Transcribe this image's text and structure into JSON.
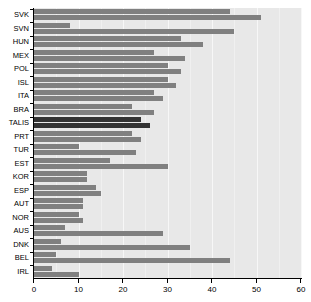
{
  "chart_data": {
    "type": "bar",
    "orientation": "horizontal",
    "title": "",
    "subtitle": "",
    "xlabel": "",
    "ylabel": "",
    "xlim": [
      0,
      60
    ],
    "xticks": [
      0,
      10,
      20,
      30,
      40,
      50,
      60
    ],
    "xticklabels": [
      "0",
      "10",
      "20",
      "30",
      "40",
      "50",
      "60"
    ],
    "grid": true,
    "grid_axis": "x",
    "legend": "none",
    "legend_position": "none",
    "highlight_category": "TALIS",
    "colors": {
      "bar": "#808080",
      "bar_highlight": "#333333",
      "panel_background": "#e8e8e8",
      "gridline": "#f7f7f7",
      "axis": "#000000"
    },
    "categories": [
      "SVK",
      "SVN",
      "HUN",
      "MEX",
      "POL",
      "ISL",
      "ITA",
      "BRA",
      "TALIS",
      "PRT",
      "TUR",
      "EST",
      "KOR",
      "ESP",
      "AUT",
      "NOR",
      "AUS",
      "DNK",
      "BEL",
      "IRL"
    ],
    "series": [
      {
        "name": "series-1",
        "values": [
          44,
          8,
          33,
          27,
          30,
          30,
          27,
          22,
          24,
          22,
          10,
          17,
          12,
          14,
          11,
          10,
          7,
          6,
          5,
          4
        ]
      },
      {
        "name": "series-2",
        "values": [
          51,
          45,
          38,
          34,
          33,
          32,
          29,
          27,
          26,
          24,
          23,
          30,
          12,
          15,
          11,
          11,
          29,
          35,
          44,
          10
        ]
      }
    ]
  }
}
